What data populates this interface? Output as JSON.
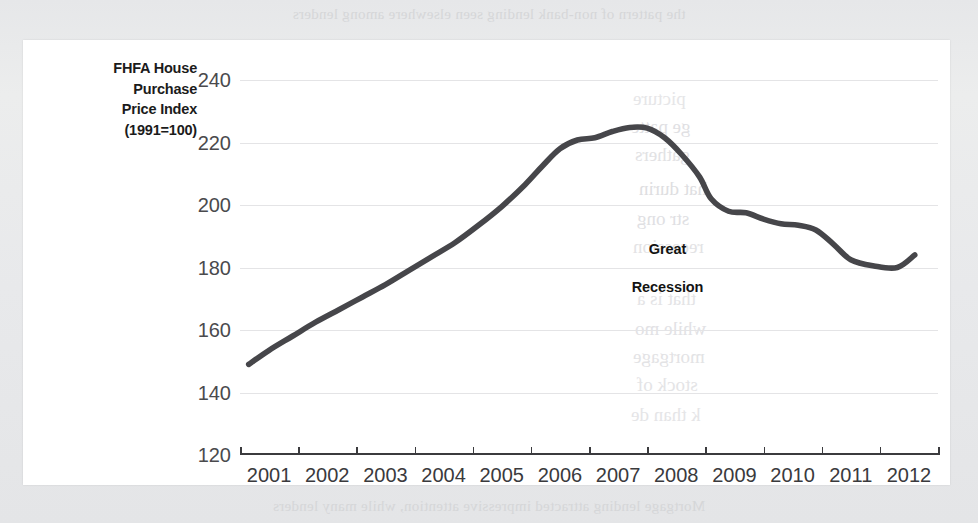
{
  "page": {
    "background_color": "#e9eaec",
    "card_color": "#ffffff",
    "ghost_text_top": "the pattern of non-bank lending seen elsewhere among lenders",
    "ghost_text_lines": [
      "picture",
      "ge patte",
      "gathers",
      "hat durin",
      "str ong",
      "recession",
      "that is a",
      "while mo",
      "mortgage",
      "stock of",
      "k than de"
    ],
    "ghost_text_bottom": "Mortgage lending attracted impressive attention, while many lenders"
  },
  "chart_data": {
    "type": "line",
    "title": "",
    "ylabel": "FHFA House Purchase Price Index (1991=100)",
    "ylabel_lines": [
      "FHFA House",
      "Purchase",
      "Price Index",
      "(1991=100)"
    ],
    "xlabel": "",
    "ylim": [
      120,
      240
    ],
    "yticks": [
      120,
      140,
      160,
      180,
      200,
      220,
      240
    ],
    "xlim": [
      2001,
      2013
    ],
    "xticks": [
      2001,
      2002,
      2003,
      2004,
      2005,
      2006,
      2007,
      2008,
      2009,
      2010,
      2011,
      2012,
      2013
    ],
    "xtick_labels": [
      "2001",
      "2002",
      "2003",
      "2004",
      "2005",
      "2006",
      "2007",
      "2008",
      "2009",
      "2010",
      "2011",
      "2012"
    ],
    "grid": "horizontal",
    "legend": "none",
    "line_color": "#46464a",
    "series": [
      {
        "name": "FHFA House Purchase Price Index",
        "x": [
          2001.15,
          2001.5,
          2001.9,
          2002.3,
          2002.7,
          2003.1,
          2003.5,
          2003.9,
          2004.3,
          2004.7,
          2005.1,
          2005.5,
          2005.9,
          2006.2,
          2006.5,
          2006.8,
          2007.1,
          2007.4,
          2007.7,
          2008.0,
          2008.3,
          2008.6,
          2008.9,
          2009.1,
          2009.4,
          2009.7,
          2010.0,
          2010.3,
          2010.6,
          2010.9,
          2011.2,
          2011.5,
          2011.9,
          2012.3,
          2012.6
        ],
        "values": [
          149.0,
          153.5,
          158.0,
          162.5,
          166.5,
          170.5,
          174.5,
          179.0,
          183.5,
          188.0,
          193.5,
          199.5,
          206.5,
          212.5,
          218.0,
          220.8,
          221.5,
          223.5,
          224.8,
          224.6,
          221.5,
          216.0,
          209.0,
          202.0,
          198.0,
          197.5,
          195.5,
          194.0,
          193.5,
          192.0,
          187.5,
          182.5,
          180.5,
          180.0,
          184.0
        ]
      }
    ],
    "annotations": [
      {
        "name": "great-recession",
        "text": "Great\nRecession",
        "line1": "Great",
        "line2": "Recession",
        "x": 2008.35,
        "y": 180
      }
    ]
  }
}
